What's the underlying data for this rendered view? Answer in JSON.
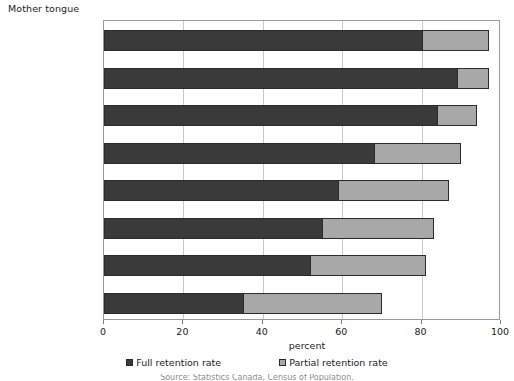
{
  "chart_data": {
    "type": "bar",
    "orientation": "horizontal",
    "stacked": true,
    "title": "",
    "group_axis_title": "Mother tongue",
    "xlabel": "percent",
    "ylabel": "",
    "xlim": [
      0,
      100
    ],
    "xticks": [
      0,
      20,
      40,
      60,
      80,
      100
    ],
    "xtick_labels": [
      "0",
      "20",
      "40",
      "60",
      "80",
      "100"
    ],
    "grid": "vertical",
    "legend_position": "bottom",
    "categories": [
      "Inuktitut",
      "Atikamekw",
      "Montagnais (Innu)",
      "Dene",
      "Oji-Cree",
      "Cree¹",
      "Mi'kmaq",
      "Ojibway"
    ],
    "series": [
      {
        "name": "Full retention rate",
        "color": "#3a3a3a",
        "values": [
          80,
          89,
          84,
          68,
          59,
          55,
          52,
          35
        ]
      },
      {
        "name": "Partial retention rate",
        "color": "#a8a8a8",
        "values": [
          17,
          8,
          10,
          22,
          28,
          28,
          29,
          35
        ]
      }
    ]
  },
  "legend": {
    "items": [
      {
        "label": "Full retention rate",
        "swatch": "full"
      },
      {
        "label": "Partial retention rate",
        "swatch": "partial"
      }
    ]
  },
  "footnote": {
    "clipped_text": "Source: Statistics Canada, Census of Population."
  }
}
